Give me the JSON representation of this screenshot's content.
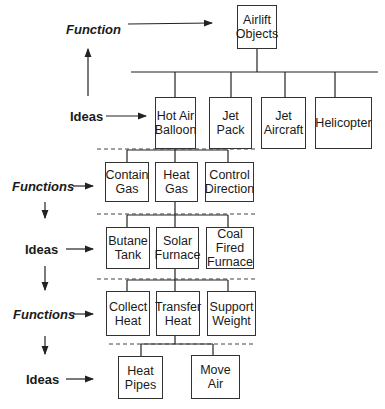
{
  "diagram": {
    "root": {
      "label": "Airlift\nObjects"
    },
    "level_labels": [
      {
        "text": "Function",
        "style": "italic"
      },
      {
        "text": "Ideas",
        "style": "normal"
      },
      {
        "text": "Functions",
        "style": "italic"
      },
      {
        "text": "Ideas",
        "style": "normal"
      },
      {
        "text": "Functions",
        "style": "italic"
      },
      {
        "text": "Ideas",
        "style": "normal"
      }
    ],
    "rows": [
      {
        "kind": "ideas",
        "items": [
          "Hot Air\nBalloon",
          "Jet\nPack",
          "Jet\nAircraft",
          "Helicopter"
        ]
      },
      {
        "kind": "functions",
        "parent": "Hot Air Balloon",
        "items": [
          "Contain\nGas",
          "Heat\nGas",
          "Control\nDirection"
        ]
      },
      {
        "kind": "ideas",
        "parent": "Heat Gas",
        "items": [
          "Butane\nTank",
          "Solar\nFurnace",
          "Coal\nFired\nFurnace"
        ]
      },
      {
        "kind": "functions",
        "parent": "Solar Furnace",
        "items": [
          "Collect\nHeat",
          "Transfer\nHeat",
          "Support\nWeight"
        ]
      },
      {
        "kind": "ideas",
        "parent": "Transfer Heat",
        "items": [
          "Heat\nPipes",
          "Move\nAir"
        ]
      }
    ]
  }
}
